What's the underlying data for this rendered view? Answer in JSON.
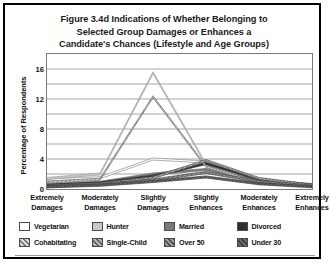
{
  "figure": {
    "title_lines": [
      "Figure 3.4d Indications of Whether Belonging to",
      "Selected Group Damages or Enhances a",
      "Candidate's Chances (Lifestyle and Age Groups)"
    ]
  },
  "chart_data": {
    "type": "line",
    "title": "Figure 3.4d Indications of Whether Belonging to Selected Group Damages or Enhances a Candidate's Chances (Lifestyle and Age Groups)",
    "xlabel": "",
    "ylabel": "Percentage of Respondents",
    "categories": [
      "Extremely Damages",
      "Moderately Damages",
      "Slightly Damages",
      "Slightly Enhances",
      "Moderately Enhances",
      "Extremely Enhances"
    ],
    "category_lines": [
      [
        "Extremely",
        "Damages"
      ],
      [
        "Moderately",
        "Damages"
      ],
      [
        "Slightly",
        "Damages"
      ],
      [
        "Slightly",
        "Enhances"
      ],
      [
        "Moderately",
        "Enhances"
      ],
      [
        "Extremely",
        "Enhances"
      ]
    ],
    "ylim": [
      0,
      18
    ],
    "yticks": [
      0,
      4,
      8,
      12,
      16
    ],
    "ygridlines": [
      0,
      2,
      4,
      6,
      8,
      10,
      12,
      14,
      16,
      18
    ],
    "grid": true,
    "legend_position": "bottom",
    "series": [
      {
        "name": "Vegetarian",
        "values": [
          1.2,
          1.5,
          4.0,
          3.6,
          1.0,
          0.5
        ],
        "color": "#ffffff",
        "pattern": "solid",
        "line_color": "#8c8c8c"
      },
      {
        "name": "Hunter",
        "values": [
          1.4,
          2.0,
          15.5,
          3.3,
          0.9,
          0.4
        ],
        "color": "#c8c8c8",
        "pattern": "solid",
        "line_color": "#a0a0a0"
      },
      {
        "name": "Married",
        "values": [
          0.6,
          0.9,
          2.0,
          2.6,
          1.1,
          0.6
        ],
        "color": "#7a7a7a",
        "pattern": "solid",
        "line_color": "#6e6e6e"
      },
      {
        "name": "Divorced",
        "values": [
          0.5,
          0.8,
          1.7,
          3.4,
          1.3,
          0.5
        ],
        "color": "#303030",
        "pattern": "solid",
        "line_color": "#2e2e2e"
      },
      {
        "name": "Cohabitating",
        "values": [
          0.9,
          1.3,
          12.3,
          3.0,
          0.8,
          0.4
        ],
        "color": "#d8d8d8",
        "pattern": "diagonal",
        "line_color": "#707070"
      },
      {
        "name": "Single-Child",
        "values": [
          0.4,
          0.7,
          1.5,
          3.8,
          1.4,
          0.5
        ],
        "color": "#b4b4b4",
        "pattern": "diagonal",
        "line_color": "#5a5a5a"
      },
      {
        "name": "Over 50",
        "values": [
          0.3,
          0.6,
          1.2,
          2.2,
          1.0,
          0.4
        ],
        "color": "#9a9a9a",
        "pattern": "diagonal",
        "line_color": "#4a4a4a"
      },
      {
        "name": "Under 30",
        "values": [
          0.3,
          0.5,
          1.0,
          1.6,
          0.7,
          0.3
        ],
        "color": "#6a6a6a",
        "pattern": "diagonal",
        "line_color": "#3a3a3a"
      }
    ]
  }
}
